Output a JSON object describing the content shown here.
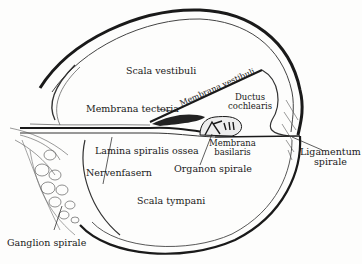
{
  "figure": {
    "colors": {
      "ink": "#1a1a1a",
      "paper": "#fdfdfc",
      "hatch": "#555555"
    },
    "labels": {
      "scala_vestibuli": "Scala vestibuli",
      "membrana_vestibuli": "Membrana vestibuli",
      "ductus_cochlearis_1": "Ductus",
      "ductus_cochlearis_2": "cochlearis",
      "membrana_tectoria": "Membrana tectoria",
      "lamina_spiralis_ossea": "Lamina spiralis ossea",
      "nervenfasern": "Nervenfasern",
      "membrana_basilaris_1": "Membrana",
      "membrana_basilaris_2": "basilaris",
      "organon_spirale": "Organon spirale",
      "ligamentum_spirale_1": "Ligamentum",
      "ligamentum_spirale_2": "spirale",
      "scala_tympani": "Scala tympani",
      "ganglion_spirale": "Ganglion spirale"
    }
  }
}
